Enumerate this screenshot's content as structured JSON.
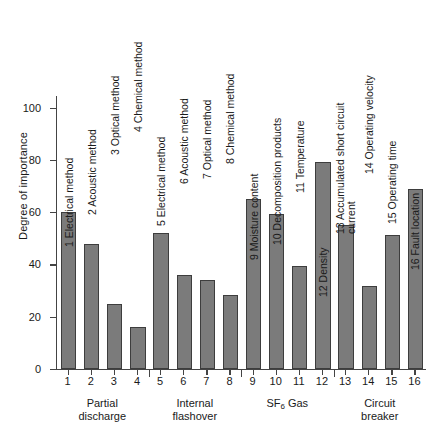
{
  "chart_data": {
    "type": "bar",
    "title": "",
    "xlabel": "",
    "ylabel": "Degree of importance",
    "ylim": [
      0,
      105
    ],
    "yticks": [
      0,
      20,
      40,
      60,
      80,
      100
    ],
    "grid": false,
    "legend": "none",
    "categories": [
      "1",
      "2",
      "3",
      "4",
      "5",
      "6",
      "7",
      "8",
      "9",
      "10",
      "11",
      "12",
      "13",
      "14",
      "15",
      "16"
    ],
    "values": [
      60,
      48,
      25,
      16,
      52,
      36,
      34,
      28.5,
      65,
      59.5,
      39.5,
      79.5,
      55,
      32,
      51.5,
      69
    ],
    "item_labels": [
      "1 Electrical method",
      "2 Acoustic method",
      "3 Optical method",
      "4 Chemical method",
      "5 Electrical method",
      "6 Acoustic method",
      "7 Optical method",
      "8 Chemical method",
      "9 Moisture content",
      "10 Decomposition products",
      "11 Temperature",
      "12 Density",
      "13 Accumulated short circuit\ncurrent",
      "14 Operating velocity",
      "15 Operating time",
      "16 Fault location"
    ],
    "groups": [
      {
        "label": "Partial\ndischarge",
        "from": 1,
        "to": 4
      },
      {
        "label": "Internal\nflashover",
        "from": 5,
        "to": 8
      },
      {
        "label": "SF6 Gas",
        "from": 9,
        "to": 12
      },
      {
        "label": "Circuit\nbreaker",
        "from": 13,
        "to": 16
      }
    ],
    "bar_color": "#7b7b7b",
    "bar_edge_color": "#3d3d3d",
    "axis_color": "#444444"
  }
}
